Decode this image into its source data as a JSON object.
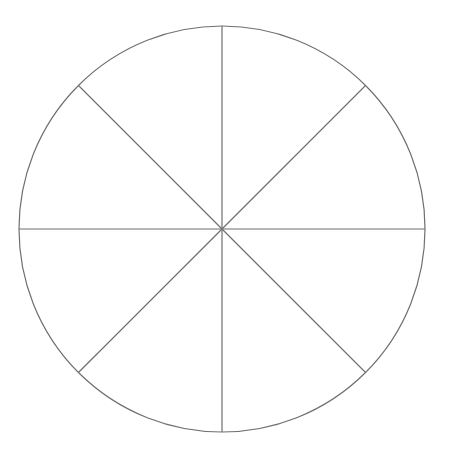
{
  "diagram": {
    "type": "divided-circle",
    "segments": 8,
    "center": [
      222,
      229
    ],
    "radius": 203,
    "stroke_color": "#6f6f6f",
    "background": "#ffffff",
    "labels": []
  }
}
